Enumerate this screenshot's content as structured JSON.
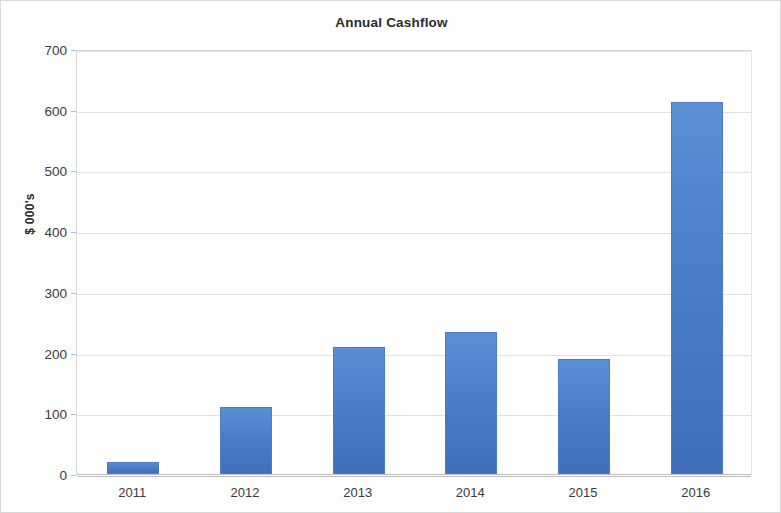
{
  "chart_data": {
    "type": "bar",
    "title": "Annual Cashflow",
    "xlabel": "",
    "ylabel": "$ 000's",
    "categories": [
      "2011",
      "2012",
      "2013",
      "2014",
      "2015",
      "2016"
    ],
    "values": [
      20,
      111,
      210,
      234,
      190,
      613
    ],
    "ylim": [
      0,
      700
    ],
    "ytick_labels": [
      "700",
      "600",
      "500",
      "400",
      "300",
      "200",
      "100",
      "0"
    ],
    "ytick_values": [
      700,
      600,
      500,
      400,
      300,
      200,
      100,
      0
    ],
    "ytick_step": 100,
    "grid": true,
    "legend": false,
    "series_color": "#4a7ec9",
    "gridline_color": "#e2e2e2",
    "axis_color": "#bdbdbd",
    "background_color": "#ffffff"
  }
}
